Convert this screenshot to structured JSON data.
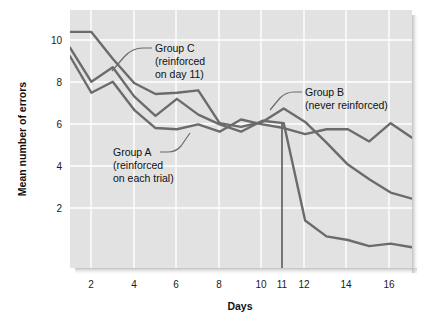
{
  "figure": {
    "name": "latent-learning-line-chart",
    "background_color": "#ffffff",
    "plot_background_color": "#e2e2e2",
    "gridline_color": "#ffffff",
    "line_color": "#6b6b6b"
  },
  "chart_data": {
    "type": "line",
    "title": "",
    "xlabel": "Days",
    "ylabel": "Mean number of errors",
    "xlim": [
      1,
      17
    ],
    "ylim": [
      0.6,
      11.2
    ],
    "grid": true,
    "legend_position": "inline-annotations",
    "xticks": [
      2,
      4,
      6,
      8,
      10,
      11,
      12,
      14,
      16
    ],
    "xtick_labels": [
      "2",
      "4",
      "6",
      "8",
      "10",
      "11",
      "12",
      "14",
      "16"
    ],
    "yticks": [
      2,
      4,
      6,
      8,
      10
    ],
    "ytick_labels": [
      "2",
      "4",
      "6",
      "8",
      "10"
    ],
    "x": [
      1,
      2,
      3,
      4,
      5,
      6,
      7,
      8,
      9,
      10,
      11,
      12,
      13,
      14,
      15,
      16,
      17
    ],
    "series": [
      {
        "name": "Group A (reinforced on each trial)",
        "label_short": "Group A",
        "values": [
          9.3,
          7.8,
          8.25,
          7.1,
          6.35,
          6.3,
          6.5,
          6.2,
          6.7,
          6.5,
          6.35,
          6.1,
          6.3,
          6.3,
          5.8,
          6.55,
          5.95
        ]
      },
      {
        "name": "Group B (never reinforced)",
        "label_short": "Group B",
        "values": [
          10.3,
          10.3,
          9.2,
          8.2,
          7.75,
          7.8,
          7.9,
          6.55,
          6.4,
          6.6,
          7.15,
          6.6,
          5.75,
          4.85,
          4.25,
          3.7,
          3.45
        ]
      },
      {
        "name": "Group C (reinforced on day 11)",
        "label_short": "Group C",
        "values": [
          9.65,
          8.25,
          8.85,
          7.65,
          6.85,
          7.55,
          6.9,
          6.5,
          6.2,
          6.65,
          6.55,
          2.55,
          1.9,
          1.75,
          1.5,
          1.6,
          1.45
        ]
      }
    ],
    "marker_line": {
      "name": "day-11-reinforcement-marker",
      "x": 11,
      "label": "11"
    },
    "annotations": [
      {
        "id": "group-c",
        "lines": [
          "Group C",
          "(reinforced",
          "on day 11)"
        ],
        "x": 155,
        "y": 52
      },
      {
        "id": "group-b",
        "lines": [
          "Group B",
          "(never reinforced)"
        ],
        "x": 305,
        "y": 96
      },
      {
        "id": "group-a",
        "lines": [
          "Group A",
          "(reinforced",
          "on each trial)"
        ],
        "x": 113,
        "y": 155
      }
    ]
  }
}
